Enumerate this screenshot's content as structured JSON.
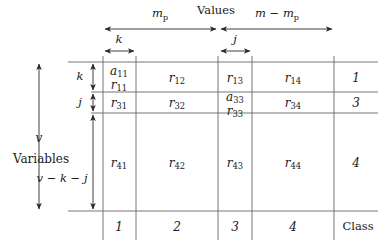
{
  "figure": {
    "title_top": "Values",
    "title_left_1": "v",
    "title_left_2": "Variables",
    "class_label": "Class"
  },
  "column_brackets": [
    {
      "name": "m_p",
      "base": "m",
      "sub": "p",
      "kind": "sub"
    },
    {
      "name": "m - m_p",
      "base": "m − m",
      "sub": "p",
      "kind": "sub"
    },
    {
      "name": "k",
      "base": "k",
      "sub": "",
      "kind": "plain"
    },
    {
      "name": "j",
      "base": "j",
      "sub": "",
      "kind": "plain"
    }
  ],
  "row_brackets": [
    {
      "name": "v",
      "text": "v"
    },
    {
      "name": "k",
      "text": "k"
    },
    {
      "name": "j",
      "text": "j"
    },
    {
      "name": "v-k-j",
      "text": "v − k − j"
    }
  ],
  "column_footer_labels": [
    "1",
    "2",
    "3",
    "4"
  ],
  "row_right_labels": [
    "1",
    "3",
    "4"
  ],
  "cells": {
    "r1c1_a": "a",
    "r1c1_a_sub": "11",
    "r1c1_r": "r",
    "r1c1_r_sub": "11",
    "r1c2": "r",
    "r1c2_sub": "12",
    "r1c3": "r",
    "r1c3_sub": "13",
    "r1c4": "r",
    "r1c4_sub": "14",
    "r2c1": "r",
    "r2c1_sub": "31",
    "r2c2": "r",
    "r2c2_sub": "32",
    "r2c3_a": "a",
    "r2c3_a_sub": "33",
    "r2c3_r": "r",
    "r2c3_r_sub": "33",
    "r2c4": "r",
    "r2c4_sub": "34",
    "r3c1": "r",
    "r3c1_sub": "41",
    "r3c2": "r",
    "r3c2_sub": "42",
    "r3c3": "r",
    "r3c3_sub": "43",
    "r3c4": "r",
    "r3c4_sub": "44"
  },
  "colors": {
    "line": "#555555",
    "text": "#1a1a1a",
    "background": "#ffffff"
  }
}
